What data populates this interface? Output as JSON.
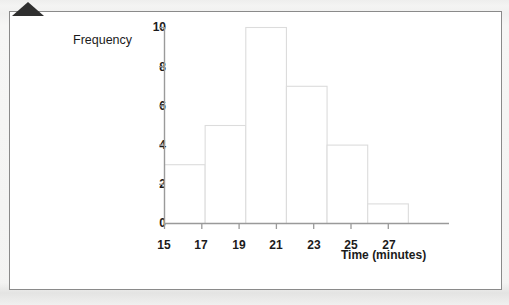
{
  "figure": {
    "corner_marker": "triangle-marker"
  },
  "chart_data": {
    "type": "bar",
    "title": "",
    "subtitle": "",
    "xlabel": "Time (minutes)",
    "ylabel": "Frequency",
    "categories": [
      "15-17",
      "17-19",
      "19-21",
      "21-23",
      "23-25",
      "25-27"
    ],
    "bin_edges": [
      15,
      17,
      19,
      21,
      23,
      25,
      27
    ],
    "values": [
      3,
      5,
      10,
      7,
      4,
      1
    ],
    "bin_width": 2,
    "xlim": [
      15,
      29
    ],
    "ylim": [
      0,
      10
    ],
    "x_ticks": [
      15,
      17,
      19,
      21,
      23,
      25,
      27
    ],
    "y_ticks": [
      0,
      2,
      4,
      6,
      8,
      10
    ],
    "x_tick_labels": [
      "15",
      "17",
      "19",
      "21",
      "23",
      "25",
      "27"
    ],
    "y_tick_labels": [
      "0",
      "2",
      "4",
      "6",
      "8",
      "10"
    ],
    "grid": false,
    "legend": false,
    "legend_position": "none",
    "bar_fill": "#ffffff",
    "bar_stroke": "#dcdcdc",
    "axis_color": "#9a9a9a",
    "text_color": "#1b1b1b"
  }
}
